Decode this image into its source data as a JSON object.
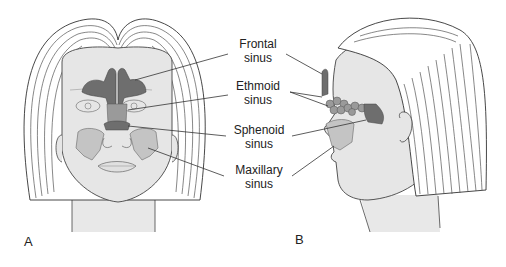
{
  "figure": {
    "panels": [
      {
        "id": "A",
        "letter": "A",
        "view": "frontal"
      },
      {
        "id": "B",
        "letter": "B",
        "view": "lateral"
      }
    ],
    "labels": [
      {
        "key": "frontal",
        "line1": "Frontal",
        "line2": "sinus"
      },
      {
        "key": "ethmoid",
        "line1": "Ethmoid",
        "line2": "sinus"
      },
      {
        "key": "sphenoid",
        "line1": "Sphenoid",
        "line2": "sinus"
      },
      {
        "key": "maxillary",
        "line1": "Maxillary",
        "line2": "sinus"
      }
    ],
    "colors": {
      "skin": "#e6e6e6",
      "outline": "#444444",
      "sinus_dark": "#6e6e6e",
      "sinus_mid": "#9a9a9a",
      "sinus_light": "#c4c4c4",
      "hair_line": "#555555",
      "background": "#ffffff"
    }
  }
}
